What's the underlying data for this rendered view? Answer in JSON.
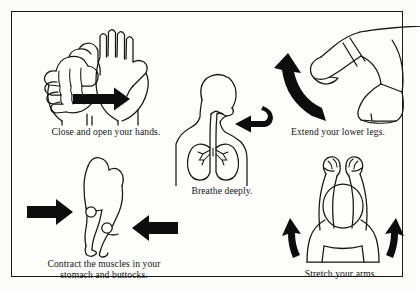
{
  "page": {
    "background_color": "#fdfdfb",
    "line_color": "#151515",
    "border_color": "#1b1b1b"
  },
  "panels": [
    {
      "id": "hands",
      "caption": "Close and open your hands.",
      "illustration": "closed-fist-and-open-palm-with-right-arrow",
      "arrow": "straight-right-arrow"
    },
    {
      "id": "breathe",
      "caption": "Breathe deeply.",
      "illustration": "torso-with-lungs-trachea-and-arrow-to-mouth",
      "arrow": "left-pointing-arrow"
    },
    {
      "id": "legs",
      "caption": "Extend your lower legs.",
      "illustration": "seated-legs-one-extended-one-bent-with-curved-arrow",
      "arrow": "curved-upward-arrow"
    },
    {
      "id": "contract",
      "caption": "Contract the muscles in your\nstomach and buttocks.",
      "illustration": "side-view-body-with-two-marked-circles",
      "arrow": "two-opposing-straight-arrows"
    },
    {
      "id": "stretch",
      "caption": "Stretch your arms.",
      "illustration": "person-from-behind-arms-raised-fists-clenched",
      "arrow": "two-curved-upward-arrows"
    }
  ]
}
